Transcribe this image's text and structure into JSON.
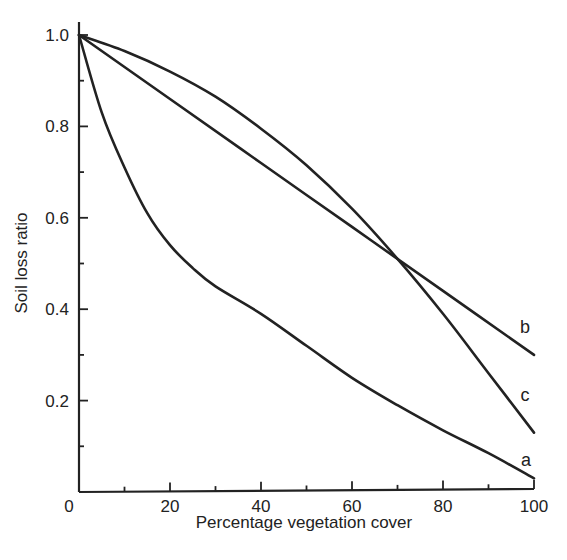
{
  "chart_data": {
    "type": "line",
    "title": "",
    "xlabel": "Percentage vegetation cover",
    "ylabel": "Soil loss ratio",
    "xlim": [
      0,
      100
    ],
    "ylim": [
      0,
      1.0
    ],
    "grid": false,
    "legend": "inline labels at right end of each curve",
    "x_ticks": [
      0,
      20,
      40,
      60,
      80,
      100
    ],
    "x_minor_ticks": [
      10,
      30,
      50,
      70,
      90
    ],
    "x_tick_labels": [
      "0",
      "20",
      "40",
      "60",
      "80",
      "100"
    ],
    "y_ticks": [
      0.2,
      0.4,
      0.6,
      0.8,
      1.0
    ],
    "y_minor_ticks": [
      0.1,
      0.3,
      0.5,
      0.7,
      0.9
    ],
    "y_tick_labels": [
      "0.2",
      "0.4",
      "0.6",
      "0.8",
      "1.0"
    ],
    "series": [
      {
        "name": "a",
        "x": [
          0,
          5,
          10,
          15,
          20,
          25,
          30,
          40,
          50,
          60,
          70,
          80,
          90,
          100
        ],
        "values": [
          1.0,
          0.83,
          0.71,
          0.61,
          0.54,
          0.49,
          0.45,
          0.39,
          0.32,
          0.25,
          0.19,
          0.135,
          0.085,
          0.03
        ]
      },
      {
        "name": "b",
        "x": [
          0,
          20,
          40,
          60,
          80,
          100
        ],
        "values": [
          1.0,
          0.86,
          0.72,
          0.58,
          0.44,
          0.3
        ]
      },
      {
        "name": "c",
        "x": [
          0,
          10,
          20,
          30,
          40,
          50,
          60,
          70,
          80,
          90,
          100
        ],
        "values": [
          1.0,
          0.965,
          0.92,
          0.865,
          0.795,
          0.715,
          0.62,
          0.51,
          0.39,
          0.26,
          0.13
        ]
      }
    ]
  },
  "plot_area": {
    "x0": 79,
    "y0": 492,
    "x1": 534,
    "y1": 35,
    "y_axis_top": 22
  }
}
